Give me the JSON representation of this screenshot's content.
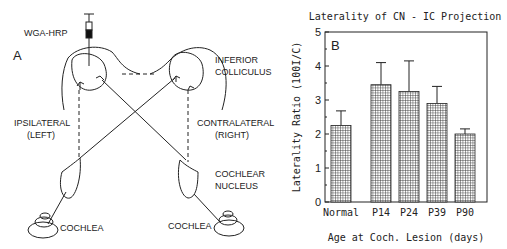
{
  "panel_a": {
    "letter": "A",
    "tracer": "WGA-HRP",
    "labels": {
      "ic_line1": "INFERIOR",
      "ic_line2": "COLLICULUS",
      "ipsi_line1": "IPSILATERAL",
      "ipsi_line2": "(LEFT)",
      "contra_line1": "CONTRALATERAL",
      "contra_line2": "(RIGHT)",
      "cn_line1": "COCHLEAR",
      "cn_line2": "NUCLEUS",
      "cochlea_left": "COCHLEA",
      "cochlea_right": "COCHLEA"
    }
  },
  "chart_data": {
    "type": "bar",
    "panel_letter": "B",
    "title": "Laterality of CN - IC Projection",
    "xlabel": "Age at Coch. Lesion (days)",
    "ylabel": "Laterality Ratio (100I/C)",
    "categories": [
      "Normal",
      "P14",
      "P24",
      "P39",
      "P90"
    ],
    "values": [
      2.25,
      3.45,
      3.25,
      2.9,
      2.0
    ],
    "error_upper": [
      2.68,
      4.1,
      4.15,
      3.4,
      2.15
    ],
    "ylim": [
      0,
      5
    ],
    "yticks": [
      "0",
      "1",
      "2",
      "3",
      "4",
      "5"
    ],
    "grid": false,
    "bar_fill": "crosshatch"
  }
}
